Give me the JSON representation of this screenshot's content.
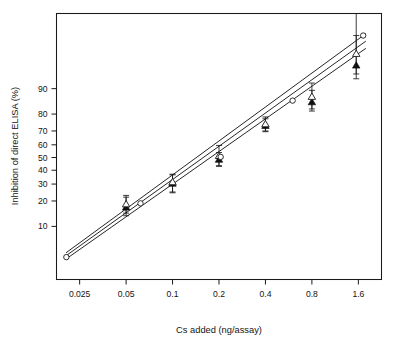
{
  "figure": {
    "title": "",
    "background": "#ffffff",
    "ink_color": "#1a1a1a"
  },
  "chart_data": {
    "type": "scatter",
    "title": "",
    "subtitle": "",
    "xlabel": "Cs added (ng/assay)",
    "ylabel": "Inhibition of direct ELISA (%)",
    "x_scale": "log2",
    "y_scale": "logit",
    "grid": false,
    "legend_position": "none",
    "xlim": [
      0.0177,
      2.26
    ],
    "ylim": [
      2.0,
      99.0
    ],
    "xticks": [
      0.025,
      0.05,
      0.1,
      0.2,
      0.4,
      0.8,
      1.6
    ],
    "xtick_labels": [
      "0.025",
      "0.05",
      "0.1",
      "0.2",
      "0.4",
      "0.8",
      "1.6"
    ],
    "yticks": [
      10,
      20,
      30,
      40,
      50,
      60,
      70,
      80,
      90
    ],
    "ytick_labels": [
      "10",
      "20",
      "30",
      "40",
      "50",
      "60",
      "70",
      "80",
      "90"
    ],
    "series": [
      {
        "name": "series-filled-triangle",
        "marker": "filled-triangle",
        "x": [
          0.05,
          0.1,
          0.2,
          0.4,
          0.8,
          1.55
        ],
        "values": [
          17.0,
          30.5,
          48.5,
          73.5,
          85.5,
          95.0
        ],
        "yerr_low": [
          3.5,
          6.0,
          5.5,
          4.0,
          4.0,
          2.5
        ],
        "yerr_high": [
          5.0,
          6.0,
          5.5,
          4.0,
          4.0,
          3.0
        ]
      },
      {
        "name": "series-open-triangle",
        "marker": "open-triangle",
        "x": [
          0.05,
          0.1,
          0.2,
          0.4,
          0.8,
          1.55
        ],
        "values": [
          18.5,
          31.5,
          51.5,
          74.5,
          87.5,
          96.5
        ],
        "yerr_low": [
          4.0,
          6.5,
          8.0,
          4.5,
          5.0,
          3.0
        ],
        "yerr_high": [
          4.5,
          5.5,
          8.0,
          4.0,
          4.0,
          2.5
        ]
      },
      {
        "name": "series-open-circle",
        "marker": "open-circle",
        "x": [
          0.0205,
          0.062,
          0.205,
          0.6,
          1.72
        ],
        "values": [
          4.0,
          18.8,
          50.5,
          86.0,
          98.0
        ],
        "yerr_low": [
          0,
          0,
          0,
          0,
          0
        ],
        "yerr_high": [
          0,
          0,
          0,
          0,
          0
        ]
      }
    ],
    "fit_lines": [
      {
        "name": "regression-line-upper",
        "x": [
          0.0205,
          1.78
        ],
        "y": [
          4.6,
          98.1
        ]
      },
      {
        "name": "regression-line-middle",
        "x": [
          0.0205,
          1.78
        ],
        "y": [
          4.2,
          97.6
        ]
      },
      {
        "name": "regression-line-lower",
        "x": [
          0.0205,
          1.78
        ],
        "y": [
          3.8,
          97.0
        ]
      }
    ],
    "annotations": []
  }
}
